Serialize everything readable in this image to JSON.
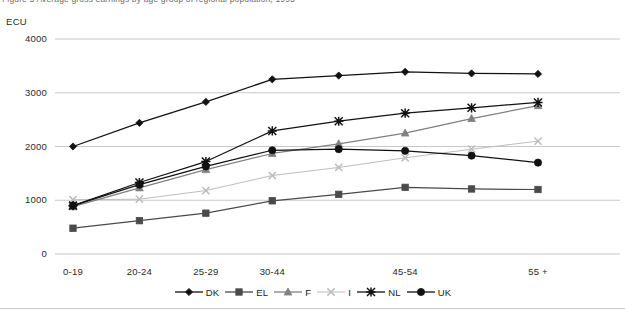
{
  "figure": {
    "title": "Figure 5  Average gross earnings by age group of regional population, 1995",
    "unit_label": "ECU"
  },
  "chart_data": {
    "type": "line",
    "title": "Figure 5  Average gross earnings by age group of regional population, 1995",
    "xlabel": "",
    "ylabel": "ECU",
    "ylim": [
      0,
      4000
    ],
    "yticks": [
      0,
      1000,
      2000,
      3000,
      4000
    ],
    "grid": true,
    "legend_position": "bottom",
    "categories": [
      "0-19",
      "20-24",
      "25-29",
      "30-44",
      "",
      "45-54",
      "",
      "55 +"
    ],
    "tick_labels": [
      "0-19",
      "20-24",
      "25-29",
      "30-44",
      "",
      "45-54",
      "",
      "55 +"
    ],
    "series": [
      {
        "name": "DK",
        "marker": "diamond",
        "color": "#111111",
        "values": [
          2000,
          2440,
          2830,
          3250,
          3320,
          3390,
          3360,
          3350
        ]
      },
      {
        "name": "EL",
        "marker": "square",
        "color": "#4a4a4a",
        "values": [
          480,
          620,
          760,
          990,
          1110,
          1240,
          1210,
          1200
        ]
      },
      {
        "name": "F",
        "marker": "triangle",
        "color": "#808080",
        "values": [
          880,
          1230,
          1570,
          1870,
          2050,
          2250,
          2520,
          2760
        ]
      },
      {
        "name": "I",
        "marker": "cross",
        "color": "#bdbdbd",
        "values": [
          1010,
          1020,
          1180,
          1460,
          1610,
          1790,
          1950,
          2100
        ]
      },
      {
        "name": "NL",
        "marker": "star",
        "color": "#111111",
        "values": [
          900,
          1330,
          1720,
          2290,
          2470,
          2620,
          2720,
          2820
        ]
      },
      {
        "name": "UK",
        "marker": "circle",
        "color": "#111111",
        "values": [
          900,
          1290,
          1630,
          1930,
          1950,
          1920,
          1830,
          1700
        ]
      }
    ]
  },
  "legend": {
    "items": [
      {
        "label": "DK"
      },
      {
        "label": "EL"
      },
      {
        "label": "F"
      },
      {
        "label": "I"
      },
      {
        "label": "NL"
      },
      {
        "label": "UK"
      }
    ]
  }
}
